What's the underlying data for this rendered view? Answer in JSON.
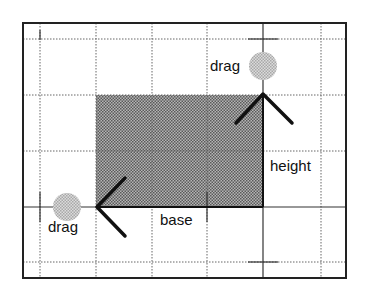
{
  "diagram": {
    "type": "resize-handle-illustration",
    "labels": {
      "drag_top": "drag",
      "drag_left": "drag",
      "height": "height",
      "base": "base"
    },
    "colors": {
      "frame": "#222222",
      "grid_dotted": "#666666",
      "rect_fill": "#8a8a8a",
      "handle_fill": "#c4c4c4",
      "arrow": "#111111"
    }
  }
}
